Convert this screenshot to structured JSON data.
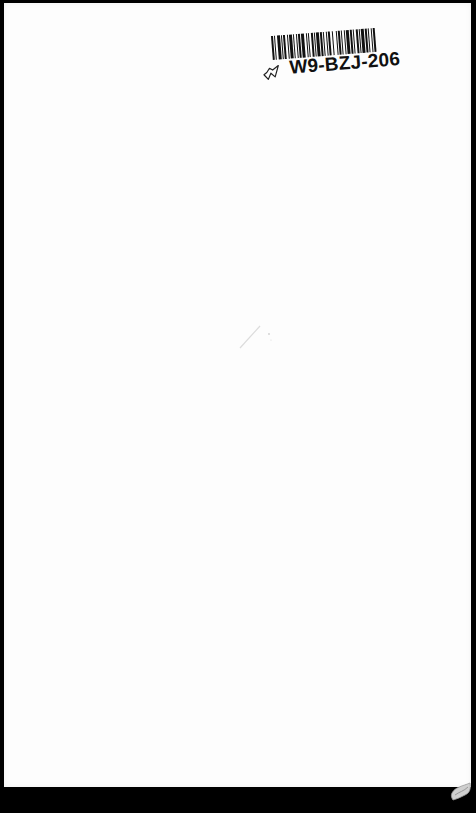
{
  "page": {
    "type": "scanned blank page",
    "background_color": "#fdfdfd",
    "border_color": "#000000"
  },
  "barcode_label": {
    "code_text": "W9-BZJ-206",
    "bar_pattern": [
      2,
      1,
      1,
      2,
      3,
      1,
      1,
      1,
      2,
      2,
      1,
      1,
      3,
      1,
      1,
      2,
      1,
      1,
      2,
      1,
      3,
      2,
      1,
      1,
      1,
      2,
      2,
      1,
      1,
      1,
      3,
      1,
      2,
      1,
      1,
      2,
      1,
      1,
      2,
      2,
      1,
      3,
      1,
      1,
      2,
      1,
      1,
      2,
      1,
      1,
      3,
      1,
      2,
      1,
      1,
      2,
      2,
      1,
      1,
      1,
      3,
      1,
      2,
      1,
      1,
      2,
      1,
      1,
      2,
      3
    ]
  },
  "annotations": {
    "handwritten_mark": "check-tick",
    "faint_mark": "pencil-stroke"
  },
  "page_curl": "bottom-right corner fold"
}
